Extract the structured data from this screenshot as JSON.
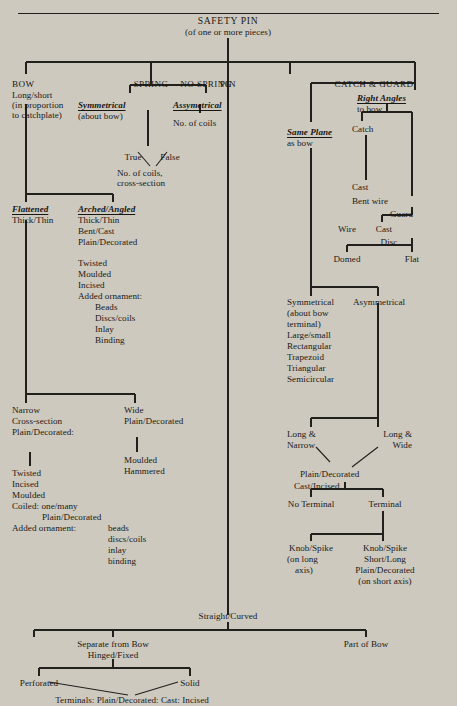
{
  "diagram": {
    "root": {
      "label": "SAFETY PIN",
      "sub": "(of one or more pieces)"
    },
    "level1": {
      "bow": "BOW",
      "spring": "SPRING",
      "no_spring": "NO SPRING",
      "pin": "PIN",
      "catch_guard": "CATCH & GUARD"
    },
    "bow_branch": {
      "line1": "Long/short",
      "line2": "(in proportion",
      "line3": "to catchplate)",
      "flattened": "Flattened",
      "flattened_sub": "Thick/Thin",
      "arched": "Arched/Angled",
      "arched_l1": "Thick/Thin",
      "arched_l2": "Bent/Cast",
      "arched_l3": "Plain/Decorated",
      "arched_l4": "Twisted",
      "arched_l5": "Moulded",
      "arched_l6": "Incised",
      "arched_l7": "Added ornament:",
      "orn1": "Beads",
      "orn2": "Discs/coils",
      "orn3": "Inlay",
      "orn4": "Binding",
      "narrow": "Narrow",
      "narrow_l1": "Cross-section",
      "narrow_l2": "Plain/Decorated:",
      "narrow_l3": "Twisted",
      "narrow_l4": "Incised",
      "narrow_l5": "Moulded",
      "narrow_l6": "Coiled: one/many",
      "narrow_l7": "Plain/Decorated",
      "narrow_l8": "Added ornament:",
      "narrow_orn1": "beads",
      "narrow_orn2": "discs/coils",
      "narrow_orn3": "inlay",
      "narrow_orn4": "binding",
      "wide": "Wide",
      "wide_l1": "Plain/Decorated",
      "wide_l2": "Moulded",
      "wide_l3": "Hammered"
    },
    "spring_branch": {
      "symmetrical": "Symmetrical",
      "symmetrical_sub": "(about bow)",
      "true": "True",
      "false": "False",
      "coils_l1": "No. of coils,",
      "coils_l2": "cross-section"
    },
    "no_spring_branch": {
      "assymetrical": "Assymetrical",
      "coils": "No. of coils"
    },
    "catch_branch": {
      "same_plane": "Same Plane",
      "same_plane_sub": "as bow",
      "right_angles": "Right Angles",
      "right_angles_sub": "to bow",
      "catch": "Catch",
      "cast": "Cast",
      "bent_wire": "Bent wire",
      "guard": "Guard",
      "wire": "Wire",
      "cast2": "Cast",
      "disc": "Disc",
      "domed": "Domed",
      "flat": "Flat",
      "symmetrical": "Symmetrical",
      "asymmetrical": "Asymmetrical",
      "sym_l1": "(about bow",
      "sym_l2": "terminal)",
      "sym_l3": "Large/small",
      "sym_l4": "Rectangular",
      "sym_l5": "Trapezoid",
      "sym_l6": "Triangular",
      "sym_l7": "Semicircular",
      "long_narrow_1": "Long &",
      "long_narrow_2": "Narrow",
      "long_wide_1": "Long &",
      "long_wide_2": "Wide",
      "plain_dec": "Plain/Decorated",
      "cast_incised": "Cast/Incised",
      "no_terminal": "No Terminal",
      "terminal": "Terminal",
      "knob_spike_l": "Knob/Spike",
      "knob_spike_l2": "(on long",
      "knob_spike_l3": "axis)",
      "knob_spike_r": "Knob/Spike",
      "knob_spike_r2": "Short/Long",
      "knob_spike_r3": "Plain/Decorated",
      "knob_spike_r4": "(on short axis)"
    },
    "pin_branch": {
      "straight_curved": "Straight/Curved",
      "separate_from_bow": "Separate from Bow",
      "hinged_fixed": "Hinged/Fixed",
      "part_of_bow": "Part of Bow",
      "perforated": "Perforated",
      "solid": "Solid",
      "terminals": "Terminals: Plain/Decorated: Cast: Incised"
    }
  },
  "colors": {
    "background": "#cdc9bf",
    "ink": "#22201c"
  }
}
